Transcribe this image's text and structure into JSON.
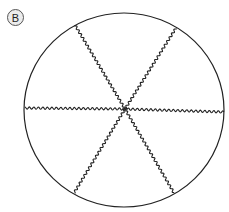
{
  "label": "B",
  "diagram": {
    "shape": "circle",
    "center": [
      124,
      110
    ],
    "rx": 100,
    "ry": 97,
    "stroke": "#222222",
    "divisions": 6,
    "line_style": "wavy",
    "spokes": [
      {
        "from": [
          125,
          109
        ],
        "to": [
          75,
          25
        ]
      },
      {
        "from": [
          125,
          109
        ],
        "to": [
          176,
          28
        ]
      },
      {
        "from": [
          125,
          109
        ],
        "to": [
          25,
          108
        ]
      },
      {
        "from": [
          125,
          109
        ],
        "to": [
          224,
          112
        ]
      },
      {
        "from": [
          125,
          109
        ],
        "to": [
          74,
          193
        ]
      },
      {
        "from": [
          125,
          109
        ],
        "to": [
          174,
          193
        ]
      }
    ]
  }
}
